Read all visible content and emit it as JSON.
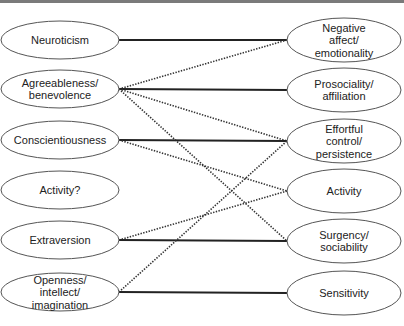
{
  "diagram": {
    "left_nodes": [
      {
        "id": "neuroticism",
        "lines": [
          "Neuroticism"
        ]
      },
      {
        "id": "agreeableness",
        "lines": [
          "Agreeableness/",
          "benevolence"
        ]
      },
      {
        "id": "conscientiousness",
        "lines": [
          "Conscientiousness"
        ]
      },
      {
        "id": "activity-q",
        "lines": [
          "Activity?"
        ]
      },
      {
        "id": "extraversion",
        "lines": [
          "Extraversion"
        ]
      },
      {
        "id": "openness",
        "lines": [
          "Openness/",
          "intellect/",
          "imagination"
        ]
      }
    ],
    "right_nodes": [
      {
        "id": "negative-affect",
        "lines": [
          "Negative",
          "affect/",
          "emotionality"
        ]
      },
      {
        "id": "prosociality",
        "lines": [
          "Prosociality/",
          "affiliation"
        ]
      },
      {
        "id": "effortful-control",
        "lines": [
          "Effortful",
          "control/",
          "persistence"
        ]
      },
      {
        "id": "activity",
        "lines": [
          "Activity"
        ]
      },
      {
        "id": "surgency",
        "lines": [
          "Surgency/",
          "sociability"
        ]
      },
      {
        "id": "sensitivity",
        "lines": [
          "Sensitivity"
        ]
      }
    ],
    "edges": [
      {
        "from": "neuroticism",
        "to": "negative-affect",
        "style": "solid"
      },
      {
        "from": "agreeableness",
        "to": "negative-affect",
        "style": "dotted"
      },
      {
        "from": "agreeableness",
        "to": "prosociality",
        "style": "solid"
      },
      {
        "from": "agreeableness",
        "to": "effortful-control",
        "style": "dotted"
      },
      {
        "from": "agreeableness",
        "to": "surgency",
        "style": "dotted"
      },
      {
        "from": "conscientiousness",
        "to": "effortful-control",
        "style": "solid"
      },
      {
        "from": "conscientiousness",
        "to": "activity",
        "style": "dotted"
      },
      {
        "from": "extraversion",
        "to": "activity",
        "style": "dotted"
      },
      {
        "from": "extraversion",
        "to": "surgency",
        "style": "solid"
      },
      {
        "from": "openness",
        "to": "effortful-control",
        "style": "dotted"
      },
      {
        "from": "openness",
        "to": "sensitivity",
        "style": "solid"
      }
    ]
  }
}
